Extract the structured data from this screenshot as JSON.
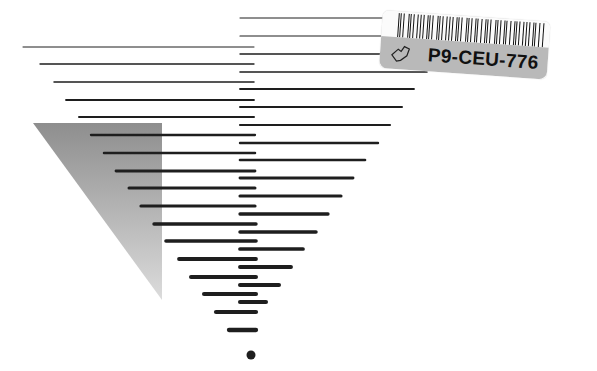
{
  "cover": {
    "background": "#ffffff",
    "line_color": "#1e1e1e",
    "triangle": {
      "points": [
        [
          33,
          123
        ],
        [
          162,
          123
        ],
        [
          162,
          300
        ]
      ],
      "gradient_top": "#8e8e8e",
      "gradient_bottom": "#dcdcdc"
    },
    "left_lines": [
      {
        "y": 47,
        "x1": 23,
        "x2": 254,
        "w": 1
      },
      {
        "y": 64,
        "x1": 40,
        "x2": 254,
        "w": 1.3
      },
      {
        "y": 82,
        "x1": 54,
        "x2": 254,
        "w": 1.5
      },
      {
        "y": 100,
        "x1": 66,
        "x2": 254,
        "w": 1.8
      },
      {
        "y": 117,
        "x1": 79,
        "x2": 254,
        "w": 2
      },
      {
        "y": 135,
        "x1": 91,
        "x2": 255,
        "w": 2.3
      },
      {
        "y": 153,
        "x1": 104,
        "x2": 255,
        "w": 2.5
      },
      {
        "y": 171,
        "x1": 116,
        "x2": 255,
        "w": 2.8
      },
      {
        "y": 188,
        "x1": 129,
        "x2": 255,
        "w": 3
      },
      {
        "y": 206,
        "x1": 141,
        "x2": 255,
        "w": 3.2
      },
      {
        "y": 224,
        "x1": 154,
        "x2": 256,
        "w": 3.4
      },
      {
        "y": 241,
        "x1": 166,
        "x2": 256,
        "w": 3.6
      },
      {
        "y": 259,
        "x1": 179,
        "x2": 256,
        "w": 3.8
      },
      {
        "y": 277,
        "x1": 191,
        "x2": 256,
        "w": 4
      },
      {
        "y": 294,
        "x1": 204,
        "x2": 256,
        "w": 4.1
      },
      {
        "y": 312,
        "x1": 216,
        "x2": 256,
        "w": 4.2
      },
      {
        "y": 330,
        "x1": 229,
        "x2": 256,
        "w": 4.3
      }
    ],
    "right_lines": [
      {
        "y": 18,
        "x1": 240,
        "x2": 465,
        "w": 1
      },
      {
        "y": 36,
        "x1": 240,
        "x2": 452,
        "w": 1.2
      },
      {
        "y": 54,
        "x1": 240,
        "x2": 440,
        "w": 1.4
      },
      {
        "y": 72,
        "x1": 240,
        "x2": 427,
        "w": 1.6
      },
      {
        "y": 89,
        "x1": 240,
        "x2": 414,
        "w": 1.8
      },
      {
        "y": 107,
        "x1": 240,
        "x2": 402,
        "w": 2
      },
      {
        "y": 125,
        "x1": 240,
        "x2": 390,
        "w": 2.2
      },
      {
        "y": 143,
        "x1": 240,
        "x2": 378,
        "w": 2.4
      },
      {
        "y": 160,
        "x1": 240,
        "x2": 365,
        "w": 2.6
      },
      {
        "y": 178,
        "x1": 240,
        "x2": 353,
        "w": 2.9
      },
      {
        "y": 196,
        "x1": 240,
        "x2": 341,
        "w": 3.1
      },
      {
        "y": 214,
        "x1": 240,
        "x2": 328,
        "w": 3.3
      },
      {
        "y": 232,
        "x1": 240,
        "x2": 316,
        "w": 3.5
      },
      {
        "y": 249,
        "x1": 240,
        "x2": 303,
        "w": 3.7
      },
      {
        "y": 267,
        "x1": 240,
        "x2": 291,
        "w": 3.9
      },
      {
        "y": 285,
        "x1": 240,
        "x2": 279,
        "w": 4
      },
      {
        "y": 302,
        "x1": 240,
        "x2": 266,
        "w": 4.1
      }
    ],
    "dot": {
      "cx": 251,
      "cy": 355,
      "r": 4.5
    }
  },
  "sticker": {
    "barcode_label": "P9-CEU-776",
    "barcode_bars": [
      2,
      1,
      3,
      1,
      1,
      2,
      3,
      1,
      2,
      1,
      1,
      3,
      2,
      1,
      2,
      2,
      1,
      3,
      1,
      1,
      2,
      1,
      3,
      2,
      1,
      1,
      2,
      3,
      1,
      2,
      1,
      1,
      3,
      1,
      2,
      2,
      1,
      3,
      1,
      2,
      1,
      1,
      2,
      3,
      1,
      2
    ],
    "band_color": "#b9b9b9",
    "icon": "hand-outline-icon"
  }
}
